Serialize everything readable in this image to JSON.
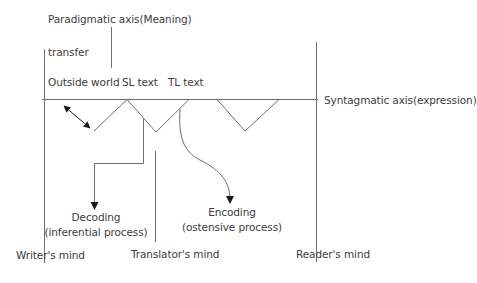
{
  "diagram": {
    "labels": {
      "paradigmatic_axis": "Paradigmatic axis(Meaning)",
      "transfer": "transfer",
      "outside_world": "Outside world",
      "sl_text": "SL text",
      "tl_text": "TL text",
      "syntagmatic_axis": "Syntagmatic axis(expression)",
      "decoding": "Decoding",
      "decoding_sub": "(inferential process)",
      "encoding": "Encoding",
      "encoding_sub": "(ostensive process)",
      "writers_mind": "Writer's mind",
      "translators_mind": "Translator's mind",
      "readers_mind": "Reader's mind"
    },
    "colors": {
      "line": "#6e6e6e",
      "arrow": "#1a1a1a",
      "text": "#3c3c3c"
    }
  }
}
